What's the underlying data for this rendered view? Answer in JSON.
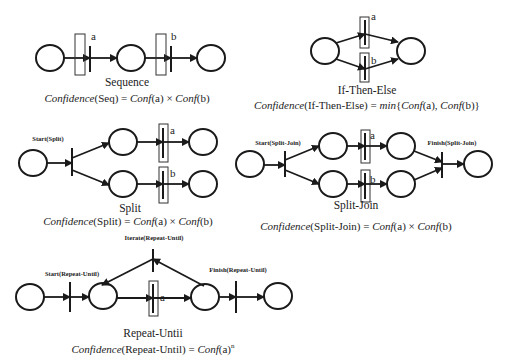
{
  "diagrams": {
    "sequence": {
      "title": "Sequence",
      "labels": [
        "a",
        "b"
      ],
      "formula_prefix": "Confidence",
      "formula_arg": "(Seq) = ",
      "formula_rest_1": "Conf",
      "formula_rest_2": "(a) × ",
      "formula_rest_3": "Conf",
      "formula_rest_4": "(b)"
    },
    "if_then_else": {
      "title": "If-Then-Else",
      "labels": [
        "a",
        "b"
      ],
      "formula_prefix": "Confidence",
      "formula_arg": "(If-Then-Else) = ",
      "formula_min": "min",
      "formula_rest_1": "{",
      "formula_conf1": "Conf",
      "formula_rest_2": "(a), ",
      "formula_conf2": "Conf",
      "formula_rest_3": "(b)}"
    },
    "split": {
      "title": "Split",
      "start_label": "Start(Split)",
      "labels": [
        "a",
        "b"
      ],
      "formula_prefix": "Confidence",
      "formula_arg": "(Split) = ",
      "formula_conf1": "Conf",
      "formula_rest_1": "(a) × ",
      "formula_conf2": "Conf",
      "formula_rest_2": "(b)"
    },
    "split_join": {
      "title": "Split-Join",
      "start_label": "Start(Split-Join)",
      "finish_label": "Finish(Split-Join)",
      "labels": [
        "a",
        "b"
      ],
      "formula_prefix": "Confidence",
      "formula_arg": "(Split-Join) = ",
      "formula_conf1": "Conf",
      "formula_rest_1": "(a) × ",
      "formula_conf2": "Conf",
      "formula_rest_2": "(b)"
    },
    "repeat_until": {
      "title": "Repeat-Untii",
      "start_label": "Start(Repeat-Until)",
      "iterate_label": "Iterate(Repeat-Until)",
      "finish_label": "Finish(Repeat-Until)",
      "labels": [
        "a"
      ],
      "formula_prefix": "Confidence",
      "formula_arg": "(Repeat-Until) = ",
      "formula_conf1": "Conf",
      "formula_rest_1": "(a)",
      "formula_sup": "n"
    }
  }
}
